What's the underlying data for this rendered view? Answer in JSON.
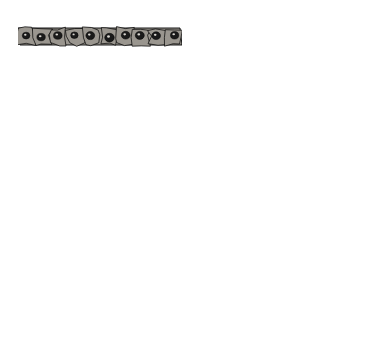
{
  "figure": {
    "background": "#ffffff",
    "ink": "#000000",
    "cell_fill": "#9a968f",
    "cell_fill_light": "#b4b0a8",
    "nucleus": "#1a1a1a",
    "width": 375,
    "height": 359
  },
  "panels": [
    {
      "id": "A",
      "letter": "A",
      "x": 17,
      "y": 14,
      "w": 166,
      "h": 74,
      "epithelium_rows": 1,
      "epithelium_top": 28,
      "epithelium_bottom": 45,
      "description": "Single-layered ectoderm over loose mesenchyme",
      "cells_per_row": 10,
      "mesenchyme_cells": 14
    },
    {
      "id": "B",
      "letter": "B",
      "x": 193,
      "y": 14,
      "w": 167,
      "h": 74,
      "epithelium_rows": 2,
      "epithelium_top": 25,
      "epithelium_bottom": 46,
      "description": "Peridermal cell layer over basal layer",
      "cells_per_row": 10,
      "mesenchyme_cells": 14
    },
    {
      "id": "C",
      "letter": "C",
      "x": 17,
      "y": 103,
      "w": 166,
      "h": 87,
      "epithelium_rows": 2,
      "epithelium_top": 108,
      "epithelium_bottom": 145,
      "description": "Bulging periderm over columnar basal layer",
      "cells_per_row": 12,
      "mesenchyme_cells": 14
    },
    {
      "id": "D",
      "letter": "D",
      "x": 193,
      "y": 103,
      "w": 167,
      "h": 87,
      "epithelium_rows": 2,
      "epithelium_top": 110,
      "epithelium_bottom": 148,
      "description": "Intermediate layer appears above basal layer",
      "cells_per_row": 12,
      "mesenchyme_cells": 16
    },
    {
      "id": "E",
      "letter": "E",
      "x": 17,
      "y": 202,
      "w": 166,
      "h": 116,
      "epithelium_rows": 5,
      "epithelium_top": 205,
      "epithelium_bottom": 285,
      "description": "Thick stratified epidermis with cornified layer and one epidermal peg",
      "cells_per_row": 13,
      "mesenchyme_cells": 12
    },
    {
      "id": "F",
      "letter": "F",
      "x": 193,
      "y": 202,
      "w": 167,
      "h": 116,
      "epithelium_rows": 5,
      "epithelium_top": 205,
      "epithelium_bottom": 290,
      "description": "Mature epidermis with deep rete ridges and dermal blood vessels",
      "cells_per_row": 13,
      "mesenchyme_cells": 8,
      "blood_vessels": 4
    }
  ],
  "labels": [
    {
      "key": "ectoderm",
      "text": "Ectoderm",
      "x": 103,
      "y": 8,
      "panel": "A"
    },
    {
      "key": "mesenchyme",
      "text": "Mesenchyme",
      "x": 63,
      "y": 90,
      "panel": "A"
    },
    {
      "key": "peridermal_cell",
      "text": "Peridermal cell",
      "x": 258,
      "y": 8,
      "panel": "B"
    },
    {
      "key": "intermediate_layer_d",
      "text": "Intermediate layer",
      "x": 239,
      "y": 97,
      "panel": "D"
    },
    {
      "key": "basal_layer_d",
      "text": "Basal layer",
      "x": 278,
      "y": 186,
      "panel": "D"
    },
    {
      "key": "cornified_layer",
      "text": "Cornified layer",
      "x": 22,
      "y": 193,
      "panel": "E"
    },
    {
      "key": "dermis",
      "text": "Dermis",
      "x": 27,
      "y": 329,
      "panel": "E"
    },
    {
      "key": "intermediate_layer_e",
      "text": "Intermediate layer",
      "x": 68,
      "y": 345,
      "panel": "E"
    },
    {
      "key": "basal_layer_e",
      "text": "Basal layer",
      "x": 136,
      "y": 329,
      "panel": "E"
    }
  ],
  "leader_lines": [
    {
      "key": "ectoderm-leader",
      "points": "112,13 105,26"
    },
    {
      "key": "mesenchyme-leader",
      "points": "68,87 64,76"
    },
    {
      "key": "peridermal-leader",
      "points": "268,13 258,24"
    },
    {
      "key": "intermediate-layer-d-leader",
      "points": "250,101 235,122"
    },
    {
      "key": "basal-layer-d-leader",
      "points": "343,184 322,140"
    },
    {
      "key": "cornified-layer-leader",
      "points": "30,196 41,210"
    },
    {
      "key": "dermis-leader",
      "points": "44,324 53,300"
    },
    {
      "key": "intermediate-layer-e-leader",
      "points": "110,340 96,288"
    },
    {
      "key": "basal-layer-e-leader",
      "points": "163,324 172,285"
    }
  ]
}
